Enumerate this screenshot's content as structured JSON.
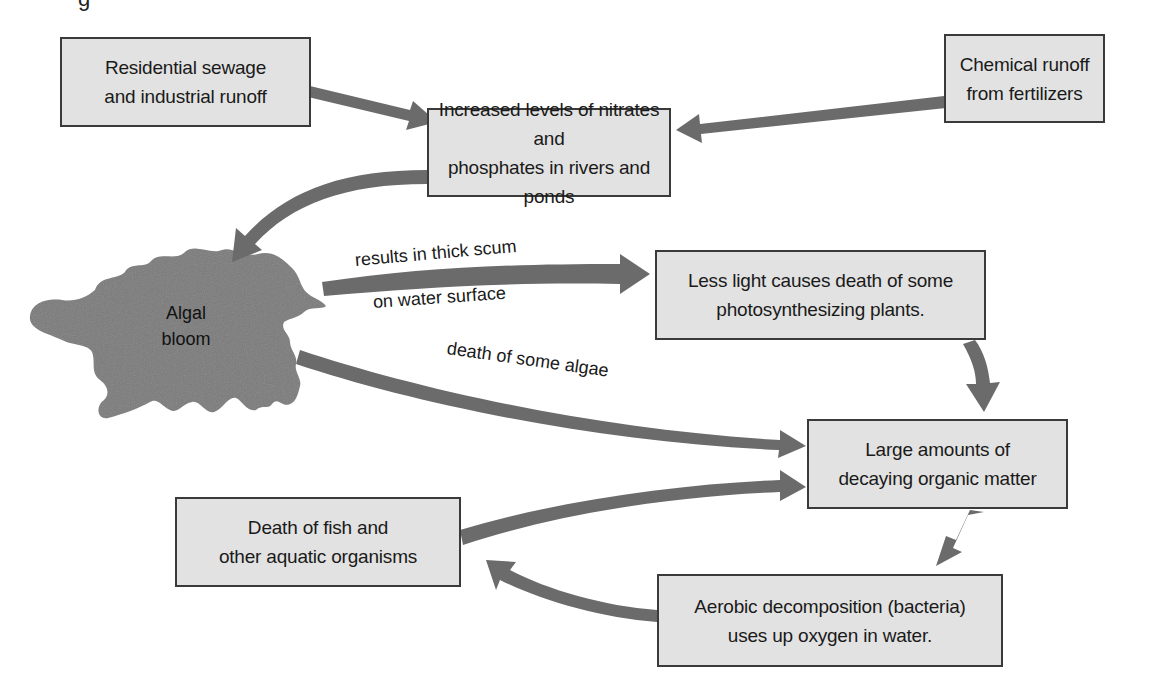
{
  "diagram": {
    "title_fragment": "g",
    "colors": {
      "box_fill": "#e2e2e2",
      "box_border": "#3a3a3a",
      "arrow": "#6b6b6b",
      "bloom": "#7a7a7a",
      "text": "#1a1a1a"
    },
    "nodes": {
      "residential": {
        "line1": "Residential sewage",
        "line2": "and industrial runoff"
      },
      "chemical": {
        "line1": "Chemical runoff",
        "line2": "from fertilizers"
      },
      "increased": {
        "line1": "Increased levels of nitrates and",
        "line2": "phosphates in rivers and ponds"
      },
      "algal_bloom": {
        "line1": "Algal",
        "line2": "bloom"
      },
      "less_light": {
        "line1": "Less light causes death of some",
        "line2": "photosynthesizing plants."
      },
      "large_amounts": {
        "line1": "Large amounts of",
        "line2": "decaying organic matter"
      },
      "death_fish": {
        "line1": "Death of fish and",
        "line2": "other aquatic organisms"
      },
      "aerobic": {
        "line1": "Aerobic decomposition (bacteria)",
        "line2": "uses up oxygen in water."
      }
    },
    "edge_labels": {
      "scum_top": "results in thick scum",
      "scum_bottom": "on water surface",
      "algae_death": "death of some algae"
    },
    "edges": [
      {
        "from": "residential",
        "to": "increased"
      },
      {
        "from": "chemical",
        "to": "increased"
      },
      {
        "from": "increased",
        "to": "algal_bloom"
      },
      {
        "from": "algal_bloom",
        "to": "less_light",
        "label": "results in thick scum on water surface"
      },
      {
        "from": "algal_bloom",
        "to": "large_amounts",
        "label": "death of some algae"
      },
      {
        "from": "less_light",
        "to": "large_amounts"
      },
      {
        "from": "death_fish",
        "to": "large_amounts"
      },
      {
        "from": "large_amounts",
        "to": "aerobic"
      },
      {
        "from": "aerobic",
        "to": "death_fish"
      }
    ]
  }
}
